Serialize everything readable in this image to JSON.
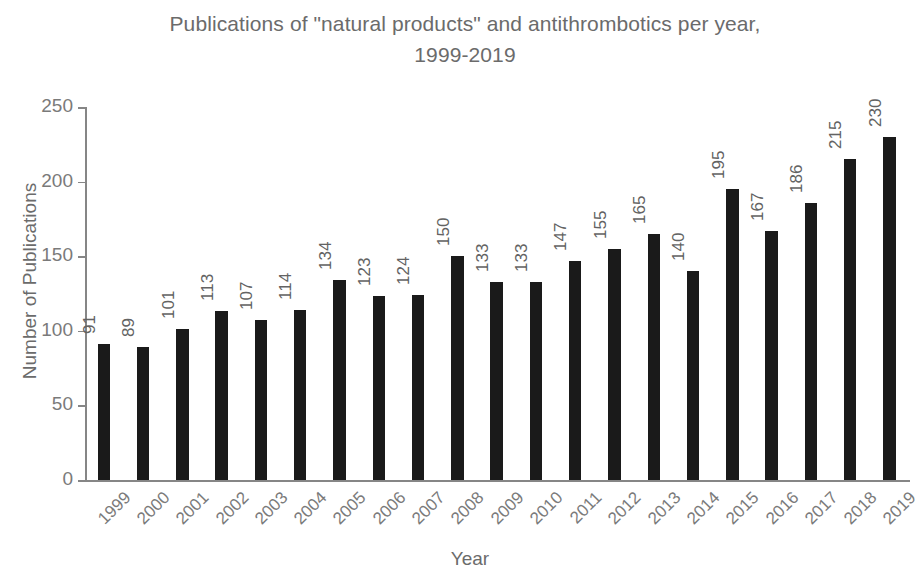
{
  "chart_data": {
    "type": "bar",
    "title": "Publications of \"natural products\" and antithrombotics per year,\n1999-2019",
    "xlabel": "Year",
    "ylabel": "Number of Publications",
    "categories": [
      "1999",
      "2000",
      "2001",
      "2002",
      "2003",
      "2004",
      "2005",
      "2006",
      "2007",
      "2008",
      "2009",
      "2010",
      "2011",
      "2012",
      "2013",
      "2014",
      "2015",
      "2016",
      "2017",
      "2018",
      "2019"
    ],
    "values": [
      91,
      89,
      101,
      113,
      107,
      114,
      134,
      123,
      124,
      150,
      133,
      133,
      147,
      155,
      165,
      140,
      195,
      167,
      186,
      215,
      230
    ],
    "ylim": [
      0,
      250
    ],
    "yticks": [
      0,
      50,
      100,
      150,
      200,
      250
    ],
    "grid": false,
    "legend": null,
    "bar_color": "#1a1a1a",
    "axis_color": "#868686",
    "text_color": "#6b6b6b",
    "data_labels": true
  }
}
